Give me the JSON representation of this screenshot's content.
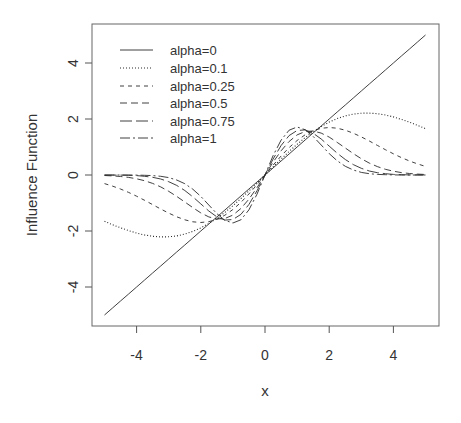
{
  "chart_data": {
    "type": "line",
    "title": "",
    "xlabel": "x",
    "ylabel": "Influence Function",
    "xlim": [
      -5.4,
      5.4
    ],
    "ylim": [
      -5.4,
      5.5
    ],
    "x_ticks": [
      -4,
      -2,
      0,
      2,
      4
    ],
    "x_tick_labels": [
      "-4",
      "-2",
      "0",
      "2",
      "4"
    ],
    "y_ticks": [
      -4,
      -2,
      0,
      2,
      4
    ],
    "y_tick_labels": [
      "-4",
      "-2",
      "0",
      "2",
      "4"
    ],
    "grid": false,
    "legend_position": "top-left",
    "x": [
      -5,
      -4.75,
      -4.5,
      -4.25,
      -4,
      -3.75,
      -3.5,
      -3.25,
      -3,
      -2.75,
      -2.5,
      -2.25,
      -2,
      -1.75,
      -1.5,
      -1.25,
      -1,
      -0.75,
      -0.5,
      -0.25,
      0,
      0.25,
      0.5,
      0.75,
      1,
      1.25,
      1.5,
      1.75,
      2,
      2.25,
      2.5,
      2.75,
      3,
      3.25,
      3.5,
      3.75,
      4,
      4.25,
      4.5,
      4.75,
      5
    ],
    "series": [
      {
        "name": "alpha=0",
        "dash": "",
        "values": [
          -5,
          -4.75,
          -4.5,
          -4.25,
          -4,
          -3.75,
          -3.5,
          -3.25,
          -3,
          -2.75,
          -2.5,
          -2.25,
          -2,
          -1.75,
          -1.5,
          -1.25,
          -1,
          -0.75,
          -0.5,
          -0.25,
          0,
          0.25,
          0.5,
          0.75,
          1,
          1.25,
          1.5,
          1.75,
          2,
          2.25,
          2.5,
          2.75,
          3,
          3.25,
          3.5,
          3.75,
          4,
          4.25,
          4.5,
          4.75,
          5
        ]
      },
      {
        "name": "alpha=0.1",
        "dash": "1 2",
        "values": [
          -1.653,
          -1.774,
          -1.886,
          -1.987,
          -2.074,
          -2.142,
          -2.189,
          -2.211,
          -2.207,
          -2.174,
          -2.11,
          -2.015,
          -1.889,
          -1.732,
          -1.546,
          -1.334,
          -1.097,
          -0.841,
          -0.57,
          -0.288,
          0,
          0.288,
          0.57,
          0.841,
          1.097,
          1.334,
          1.546,
          1.732,
          1.889,
          2.015,
          2.11,
          2.174,
          2.207,
          2.211,
          2.189,
          2.142,
          2.074,
          1.987,
          1.886,
          1.774,
          1.653
        ]
      },
      {
        "name": "alpha=0.25",
        "dash": "4 4",
        "values": [
          -0.307,
          -0.396,
          -0.5,
          -0.621,
          -0.757,
          -0.904,
          -1.058,
          -1.213,
          -1.361,
          -1.493,
          -1.599,
          -1.67,
          -1.695,
          -1.668,
          -1.582,
          -1.437,
          -1.233,
          -0.977,
          -0.677,
          -0.347,
          0,
          0.347,
          0.677,
          0.977,
          1.233,
          1.437,
          1.582,
          1.668,
          1.695,
          1.67,
          1.599,
          1.493,
          1.361,
          1.213,
          1.058,
          0.904,
          0.757,
          0.621,
          0.5,
          0.396,
          0.307
        ]
      },
      {
        "name": "alpha=0.5",
        "dash": "7 4",
        "values": [
          -0.018,
          -0.031,
          -0.052,
          -0.085,
          -0.135,
          -0.205,
          -0.301,
          -0.426,
          -0.581,
          -0.763,
          -0.963,
          -1.166,
          -1.352,
          -1.495,
          -1.57,
          -1.554,
          -1.431,
          -1.197,
          -0.863,
          -0.452,
          0,
          0.452,
          0.863,
          1.197,
          1.431,
          1.554,
          1.57,
          1.495,
          1.352,
          1.166,
          0.963,
          0.763,
          0.581,
          0.426,
          0.301,
          0.205,
          0.135,
          0.085,
          0.052,
          0.031,
          0.018
        ]
      },
      {
        "name": "alpha=0.75",
        "dash": "12 4",
        "values": [
          -0.001,
          -0.002,
          -0.005,
          -0.011,
          -0.023,
          -0.045,
          -0.082,
          -0.143,
          -0.238,
          -0.373,
          -0.555,
          -0.78,
          -1.033,
          -1.285,
          -1.493,
          -1.611,
          -1.591,
          -1.406,
          -1.054,
          -0.565,
          0,
          0.565,
          1.054,
          1.406,
          1.591,
          1.611,
          1.493,
          1.285,
          1.033,
          0.78,
          0.555,
          0.373,
          0.238,
          0.143,
          0.082,
          0.045,
          0.023,
          0.011,
          0.005,
          0.002,
          0.001
        ]
      },
      {
        "name": "alpha=1",
        "dash": "10 3 2 3",
        "values": [
          0,
          0,
          -0.001,
          -0.001,
          -0.004,
          -0.009,
          -0.022,
          -0.047,
          -0.094,
          -0.177,
          -0.311,
          -0.506,
          -0.766,
          -1.071,
          -1.378,
          -1.619,
          -1.716,
          -1.601,
          -1.248,
          -0.685,
          0,
          0.685,
          1.248,
          1.601,
          1.716,
          1.619,
          1.378,
          1.071,
          0.766,
          0.506,
          0.311,
          0.177,
          0.094,
          0.047,
          0.022,
          0.009,
          0.004,
          0.001,
          0.001,
          0,
          0
        ]
      }
    ]
  },
  "axes": {
    "xlabel": "x",
    "ylabel": "Influence Function"
  },
  "legend": [
    {
      "label": "alpha=0"
    },
    {
      "label": "alpha=0.1"
    },
    {
      "label": "alpha=0.25"
    },
    {
      "label": "alpha=0.5"
    },
    {
      "label": "alpha=0.75"
    },
    {
      "label": "alpha=1"
    }
  ],
  "style": {
    "line_color": "#2b2b2b",
    "axis_color": "#555555",
    "text_color": "#333333"
  }
}
